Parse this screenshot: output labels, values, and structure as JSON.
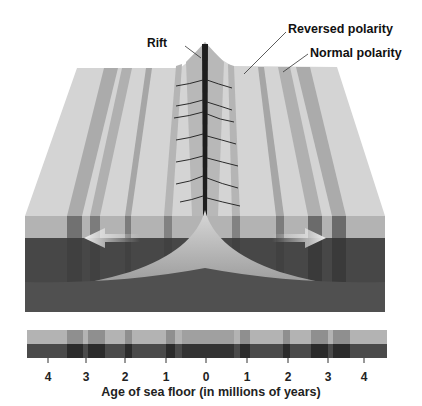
{
  "labels": {
    "rift": "Rift",
    "reversed": "Reversed polarity",
    "normal": "Normal polarity"
  },
  "axis": {
    "title": "Age of sea floor (in millions of years)",
    "ticks": [
      "4",
      "3",
      "2",
      "1",
      "0",
      "1",
      "2",
      "3",
      "4"
    ]
  },
  "colors": {
    "surface_light": "#d4d4d4",
    "surface_dark": "#a9a9a9",
    "face_light": "#b3b3b3",
    "face_dark": "#474747",
    "magma": "#c8c8c8",
    "arrow": "#e8e8e8",
    "text": "#111111"
  },
  "arrows": [
    "left-spreading-arrow",
    "right-spreading-arrow"
  ]
}
